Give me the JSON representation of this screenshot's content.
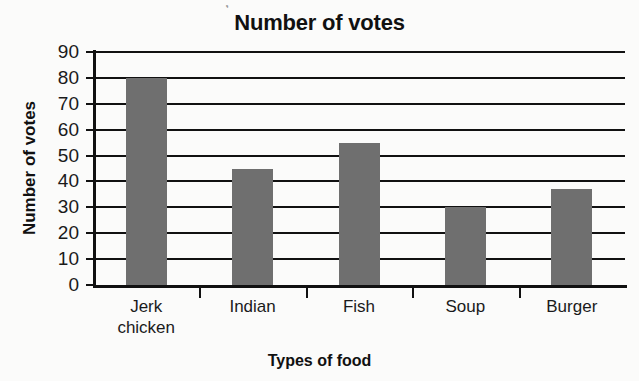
{
  "chart_data": {
    "type": "bar",
    "title": "Number of votes",
    "xlabel": "Types of food",
    "ylabel": "Number of votes",
    "categories": [
      "Jerk chicken",
      "Indian",
      "Fish",
      "Soup",
      "Burger"
    ],
    "values": [
      80,
      45,
      55,
      30,
      37
    ],
    "ylim": [
      0,
      90
    ],
    "ytick_step": 10,
    "yticks": [
      "90",
      "80",
      "70",
      "60",
      "50",
      "40",
      "30",
      "20",
      "10",
      "0"
    ],
    "grid": "horizontal",
    "legend": "none",
    "bar_color": "#6f6f6f",
    "axis_color": "#111111",
    "background_color": "#fbfbfa"
  },
  "artifact": {
    "top_mark": ","
  }
}
